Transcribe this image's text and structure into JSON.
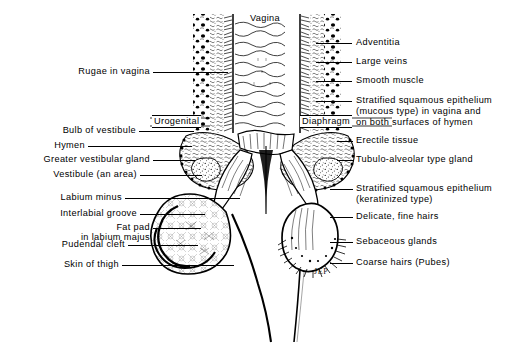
{
  "figure": {
    "signature": "JEP",
    "ink_color": "#000000",
    "background_color": "#ffffff"
  },
  "center_labels": {
    "vagina": "Vagina",
    "urogenital": "Urogenital",
    "diaphragm": "Diaphragm"
  },
  "left_labels": [
    {
      "text": "Rugae in vagina"
    },
    {
      "text": "Bulb of vestibule"
    },
    {
      "text": "Hymen"
    },
    {
      "text": "Greater vestibular gland"
    },
    {
      "text": "Vestibule (an area)"
    },
    {
      "text": "Labium minus"
    },
    {
      "text": "Interlabial groove"
    },
    {
      "text": "Fat pad"
    },
    {
      "text": "in labium majus"
    },
    {
      "text": "Pudendal cleft"
    },
    {
      "text": "Skin of thigh"
    }
  ],
  "right_labels": [
    {
      "text": "Adventitia"
    },
    {
      "text": "Large veins"
    },
    {
      "text": "Smooth muscle"
    },
    {
      "text": "Stratified squamous epithelium"
    },
    {
      "text": "(mucous type) in vagina and"
    },
    {
      "text": "on both surfaces of hymen"
    },
    {
      "text": "Erectile tissue"
    },
    {
      "text": "Tubulo-alveolar type gland"
    },
    {
      "text": "Stratified squamous epithelium"
    },
    {
      "text": "(keratinized type)"
    },
    {
      "text": "Delicate, fine hairs"
    },
    {
      "text": "Sebaceous glands"
    },
    {
      "text": "Coarse hairs (Pubes)"
    }
  ]
}
